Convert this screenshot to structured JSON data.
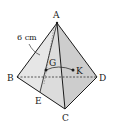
{
  "figure": {
    "type": "triangular pyramid (tetrahedron)",
    "vertices": {
      "A": {
        "label": "A",
        "x": 57,
        "y": 23
      },
      "B": {
        "label": "B",
        "x": 17,
        "y": 77
      },
      "C": {
        "label": "C",
        "x": 65,
        "y": 109
      },
      "D": {
        "label": "D",
        "x": 97,
        "y": 77
      },
      "E": {
        "label": "E",
        "x": 40,
        "y": 92
      }
    },
    "points": {
      "G": {
        "label": "G",
        "x": 46,
        "y": 70
      },
      "K": {
        "label": "K",
        "x": 73,
        "y": 70
      }
    },
    "measure": {
      "text": "6 cm",
      "edge": "AB"
    },
    "colors": {
      "line": "#1a1a1a",
      "face_left": "#d9d9d9",
      "face_front": "#ececec",
      "face_right": "#cfcfcf",
      "dashed": "#333333"
    }
  }
}
